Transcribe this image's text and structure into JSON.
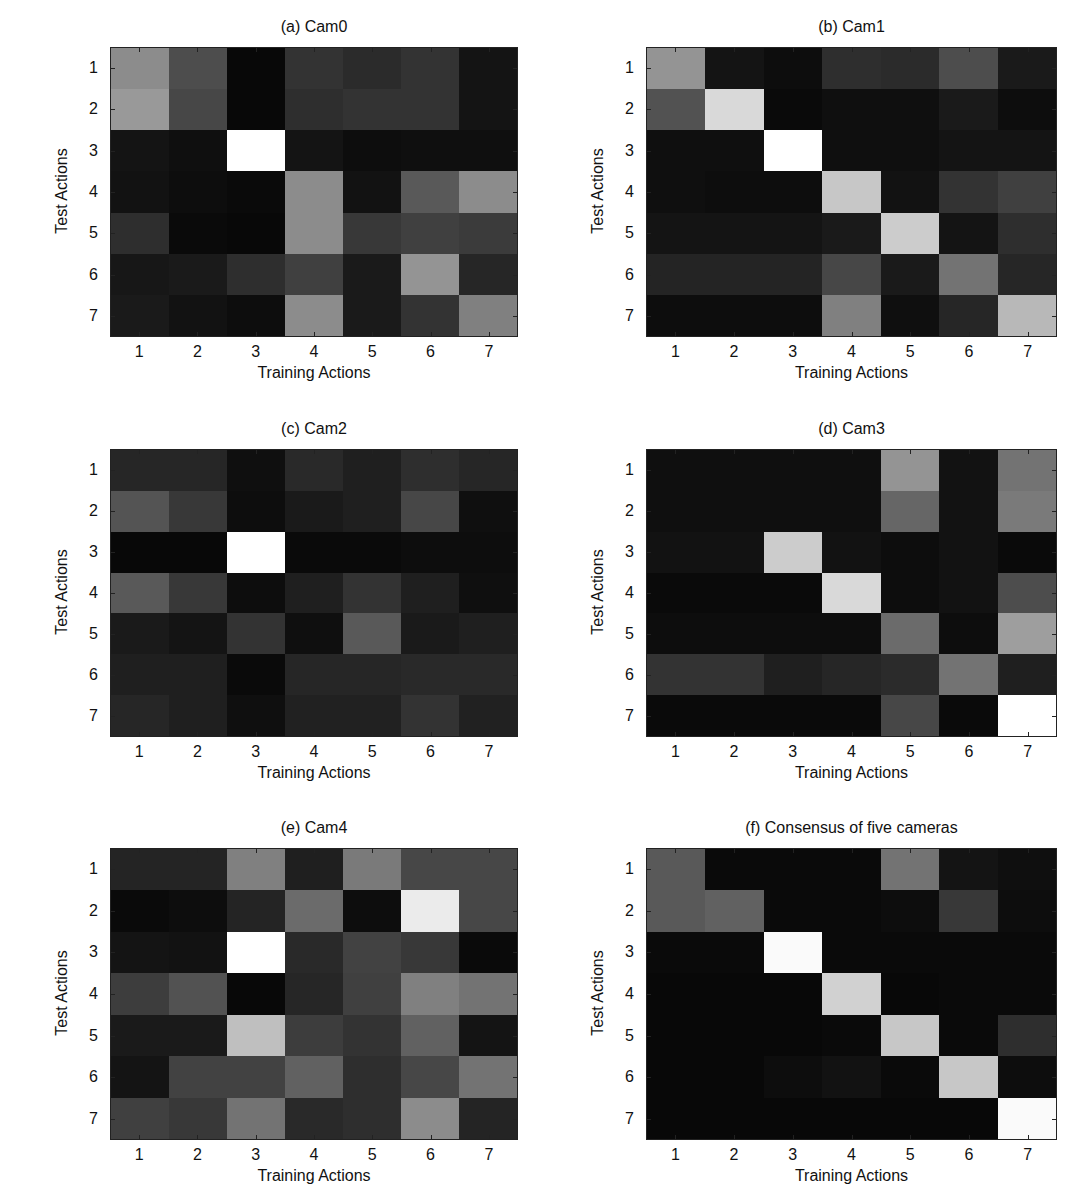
{
  "figure": {
    "xlabel": "Training Actions",
    "ylabel": "Test Actions",
    "ticks": [
      "1",
      "2",
      "3",
      "4",
      "5",
      "6",
      "7"
    ]
  },
  "chart_data": [
    {
      "type": "heatmap",
      "title": "(a) Cam0",
      "xlabel": "Training Actions",
      "ylabel": "Test Actions",
      "x": [
        1,
        2,
        3,
        4,
        5,
        6,
        7
      ],
      "y": [
        1,
        2,
        3,
        4,
        5,
        6,
        7
      ],
      "colormap": "gray (0=black, 1=white)",
      "values": [
        [
          0.55,
          0.3,
          0.03,
          0.2,
          0.17,
          0.2,
          0.08
        ],
        [
          0.6,
          0.28,
          0.03,
          0.18,
          0.2,
          0.2,
          0.08
        ],
        [
          0.08,
          0.06,
          1.0,
          0.08,
          0.05,
          0.06,
          0.06
        ],
        [
          0.07,
          0.05,
          0.04,
          0.55,
          0.07,
          0.35,
          0.55
        ],
        [
          0.18,
          0.04,
          0.03,
          0.55,
          0.22,
          0.25,
          0.23
        ],
        [
          0.09,
          0.1,
          0.18,
          0.25,
          0.1,
          0.58,
          0.15
        ],
        [
          0.1,
          0.07,
          0.05,
          0.55,
          0.1,
          0.2,
          0.5
        ]
      ]
    },
    {
      "type": "heatmap",
      "title": "(b) Cam1",
      "xlabel": "Training Actions",
      "ylabel": "Test Actions",
      "x": [
        1,
        2,
        3,
        4,
        5,
        6,
        7
      ],
      "y": [
        1,
        2,
        3,
        4,
        5,
        6,
        7
      ],
      "colormap": "gray (0=black, 1=white)",
      "values": [
        [
          0.58,
          0.08,
          0.05,
          0.18,
          0.17,
          0.3,
          0.1
        ],
        [
          0.32,
          0.85,
          0.04,
          0.06,
          0.06,
          0.1,
          0.05
        ],
        [
          0.06,
          0.06,
          1.0,
          0.06,
          0.06,
          0.08,
          0.08
        ],
        [
          0.06,
          0.05,
          0.05,
          0.78,
          0.07,
          0.2,
          0.25
        ],
        [
          0.08,
          0.08,
          0.08,
          0.1,
          0.8,
          0.08,
          0.18
        ],
        [
          0.14,
          0.14,
          0.14,
          0.28,
          0.1,
          0.45,
          0.15
        ],
        [
          0.05,
          0.05,
          0.05,
          0.5,
          0.06,
          0.15,
          0.72
        ]
      ]
    },
    {
      "type": "heatmap",
      "title": "(c) Cam2",
      "xlabel": "Training Actions",
      "ylabel": "Test Actions",
      "x": [
        1,
        2,
        3,
        4,
        5,
        6,
        7
      ],
      "y": [
        1,
        2,
        3,
        4,
        5,
        6,
        7
      ],
      "colormap": "gray (0=black, 1=white)",
      "values": [
        [
          0.15,
          0.15,
          0.06,
          0.16,
          0.12,
          0.18,
          0.15
        ],
        [
          0.33,
          0.22,
          0.05,
          0.1,
          0.12,
          0.28,
          0.06
        ],
        [
          0.03,
          0.03,
          1.0,
          0.04,
          0.04,
          0.05,
          0.05
        ],
        [
          0.35,
          0.22,
          0.05,
          0.12,
          0.2,
          0.12,
          0.06
        ],
        [
          0.1,
          0.08,
          0.2,
          0.06,
          0.35,
          0.1,
          0.12
        ],
        [
          0.12,
          0.12,
          0.04,
          0.15,
          0.15,
          0.16,
          0.16
        ],
        [
          0.15,
          0.12,
          0.06,
          0.13,
          0.13,
          0.2,
          0.13
        ]
      ]
    },
    {
      "type": "heatmap",
      "title": "(d) Cam3",
      "xlabel": "Training Actions",
      "ylabel": "Test Actions",
      "x": [
        1,
        2,
        3,
        4,
        5,
        6,
        7
      ],
      "y": [
        1,
        2,
        3,
        4,
        5,
        6,
        7
      ],
      "colormap": "gray (0=black, 1=white)",
      "values": [
        [
          0.06,
          0.06,
          0.06,
          0.06,
          0.58,
          0.07,
          0.45
        ],
        [
          0.06,
          0.06,
          0.06,
          0.06,
          0.4,
          0.07,
          0.48
        ],
        [
          0.07,
          0.07,
          0.8,
          0.07,
          0.05,
          0.07,
          0.04
        ],
        [
          0.04,
          0.04,
          0.04,
          0.85,
          0.05,
          0.07,
          0.3
        ],
        [
          0.05,
          0.05,
          0.05,
          0.05,
          0.42,
          0.05,
          0.62
        ],
        [
          0.2,
          0.2,
          0.12,
          0.15,
          0.17,
          0.45,
          0.12
        ],
        [
          0.04,
          0.04,
          0.04,
          0.04,
          0.28,
          0.04,
          1.0
        ]
      ]
    },
    {
      "type": "heatmap",
      "title": "(e) Cam4",
      "xlabel": "Training Actions",
      "ylabel": "Test Actions",
      "x": [
        1,
        2,
        3,
        4,
        5,
        6,
        7
      ],
      "y": [
        1,
        2,
        3,
        4,
        5,
        6,
        7
      ],
      "colormap": "gray (0=black, 1=white)",
      "values": [
        [
          0.14,
          0.14,
          0.5,
          0.12,
          0.48,
          0.28,
          0.28
        ],
        [
          0.04,
          0.05,
          0.14,
          0.42,
          0.05,
          0.92,
          0.28
        ],
        [
          0.08,
          0.07,
          1.0,
          0.16,
          0.26,
          0.22,
          0.04
        ],
        [
          0.24,
          0.32,
          0.03,
          0.15,
          0.25,
          0.5,
          0.45
        ],
        [
          0.1,
          0.1,
          0.75,
          0.24,
          0.2,
          0.38,
          0.08
        ],
        [
          0.08,
          0.26,
          0.26,
          0.38,
          0.18,
          0.28,
          0.45
        ],
        [
          0.25,
          0.22,
          0.45,
          0.16,
          0.18,
          0.55,
          0.14
        ]
      ]
    },
    {
      "type": "heatmap",
      "title": "(f) Consensus of five cameras",
      "xlabel": "Training Actions",
      "ylabel": "Test Actions",
      "x": [
        1,
        2,
        3,
        4,
        5,
        6,
        7
      ],
      "y": [
        1,
        2,
        3,
        4,
        5,
        6,
        7
      ],
      "colormap": "gray (0=black, 1=white)",
      "values": [
        [
          0.35,
          0.04,
          0.04,
          0.04,
          0.45,
          0.08,
          0.06
        ],
        [
          0.35,
          0.38,
          0.04,
          0.04,
          0.05,
          0.22,
          0.05
        ],
        [
          0.04,
          0.04,
          0.98,
          0.04,
          0.04,
          0.04,
          0.04
        ],
        [
          0.03,
          0.03,
          0.03,
          0.82,
          0.03,
          0.04,
          0.04
        ],
        [
          0.03,
          0.03,
          0.03,
          0.04,
          0.78,
          0.04,
          0.18
        ],
        [
          0.03,
          0.03,
          0.05,
          0.07,
          0.04,
          0.78,
          0.05
        ],
        [
          0.03,
          0.03,
          0.03,
          0.03,
          0.03,
          0.03,
          0.98
        ]
      ]
    }
  ]
}
